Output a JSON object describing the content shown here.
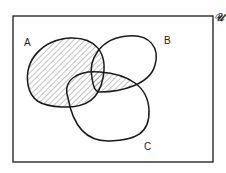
{
  "diagram": {
    "type": "venn",
    "universe_label": "𝒰",
    "sets": [
      {
        "label": "A"
      },
      {
        "label": "B"
      },
      {
        "label": "C"
      }
    ],
    "shaded_region": "A ∪ (B ∩ C)",
    "colors": {
      "stroke": "#1a1a1a",
      "hatch": "#555555",
      "background": "#ffffff"
    }
  }
}
